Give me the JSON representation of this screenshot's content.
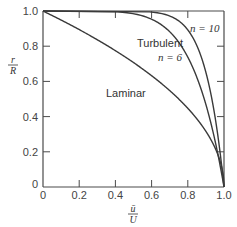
{
  "chart_data": {
    "type": "line",
    "title": "",
    "xlabel": "ū/U",
    "ylabel": "r/R",
    "xlim": [
      0,
      1.0
    ],
    "ylim": [
      0,
      1.0
    ],
    "x_ticks": [
      "0",
      "0.2",
      "0.4",
      "0.6",
      "0.8",
      "1.0"
    ],
    "y_ticks": [
      "0",
      "0.2",
      "0.4",
      "0.6",
      "0.8",
      "1.0"
    ],
    "grid": false,
    "legend": null,
    "series": [
      {
        "name": "Laminar",
        "formula": "u/U = 1 - (r/R)^2",
        "points": [
          [
            1.0,
            0.0
          ],
          [
            0.96,
            0.2
          ],
          [
            0.84,
            0.4
          ],
          [
            0.64,
            0.6
          ],
          [
            0.36,
            0.8
          ],
          [
            0.0,
            1.0
          ]
        ]
      },
      {
        "name": "Turbulent n = 6",
        "formula": "u/U = (1 - r/R)^(1/6)",
        "points": [
          [
            1.0,
            0.0
          ],
          [
            0.963,
            0.2
          ],
          [
            0.918,
            0.4
          ],
          [
            0.858,
            0.6
          ],
          [
            0.765,
            0.8
          ],
          [
            0.681,
            0.9
          ],
          [
            0.464,
            0.99
          ],
          [
            0.0,
            1.0
          ]
        ]
      },
      {
        "name": "Turbulent n = 10",
        "formula": "u/U = (1 - r/R)^(1/10)",
        "points": [
          [
            1.0,
            0.0
          ],
          [
            0.978,
            0.2
          ],
          [
            0.95,
            0.4
          ],
          [
            0.912,
            0.6
          ],
          [
            0.851,
            0.8
          ],
          [
            0.794,
            0.9
          ],
          [
            0.631,
            0.99
          ],
          [
            0.0,
            1.0
          ]
        ]
      }
    ],
    "annotations": [
      "Laminar",
      "Turbulent",
      "n = 6",
      "n = 10"
    ]
  },
  "labels": {
    "y_axis_num": "r",
    "y_axis_den": "R",
    "x_axis_num": "ū",
    "x_axis_den": "U",
    "laminar": "Laminar",
    "turbulent": "Turbulent",
    "n6": "n = 6",
    "n10": "n = 10",
    "x0": "0",
    "x02": "0.2",
    "x04": "0.4",
    "x06": "0.6",
    "x08": "0.8",
    "x10": "1.0",
    "y0": "0",
    "y02": "0.2",
    "y04": "0.4",
    "y06": "0.6",
    "y08": "0.8",
    "y10": "1.0"
  },
  "colors": {
    "curve": "#3a3a3a",
    "axis": "#4a4a4a"
  }
}
